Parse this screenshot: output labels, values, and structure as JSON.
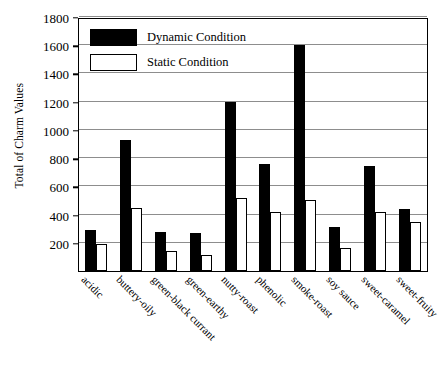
{
  "chart_data": {
    "type": "bar",
    "title": "",
    "xlabel": "",
    "ylabel": "Total of Charm Values",
    "ylim": [
      0,
      1800
    ],
    "ytick_step": 200,
    "yticks": [
      200,
      400,
      600,
      800,
      1000,
      1200,
      1400,
      1600,
      1800
    ],
    "grid": true,
    "legend_position": "top-left",
    "categories": [
      "acidic",
      "buttery-oily",
      "green-black currant",
      "green-earthy",
      "nutty-roast",
      "phenolic",
      "smoke-roast",
      "soy sauce",
      "sweet-caramel",
      "sweet-fruity"
    ],
    "series": [
      {
        "name": "Dynamic Condition",
        "color": "#000000",
        "values": [
          290,
          930,
          280,
          270,
          1200,
          760,
          1600,
          310,
          745,
          440
        ]
      },
      {
        "name": "Static Condition",
        "color": "#ffffff",
        "values": [
          190,
          450,
          140,
          110,
          520,
          420,
          500,
          160,
          420,
          345
        ]
      }
    ]
  },
  "legend": {
    "items": [
      {
        "label": "Dynamic Condition",
        "swatch": "filled-black-square"
      },
      {
        "label": "Static Condition",
        "swatch": "outlined-white-square"
      }
    ]
  },
  "axes": {
    "y_title": "Total of Charm Values"
  }
}
